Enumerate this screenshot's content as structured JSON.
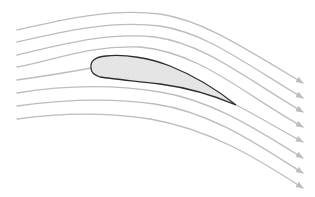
{
  "diagram": {
    "title": "",
    "colors": {
      "background": "#ffffff",
      "streamline": "#bdbdbd",
      "arrowhead": "#bdbdbd",
      "airfoil_fill": "#e4e4e4",
      "airfoil_stroke": "#2e2e2e"
    },
    "airfoil": {
      "label": "airfoil",
      "leading_edge": [
        91,
        68
      ],
      "trailing_edge": [
        236,
        105
      ]
    },
    "streamlines": [
      {
        "id": "streamline-1",
        "start": [
          17,
          30
        ],
        "end": [
          303,
          83
        ]
      },
      {
        "id": "streamline-2",
        "start": [
          17,
          42
        ],
        "end": [
          303,
          98
        ]
      },
      {
        "id": "streamline-3",
        "start": [
          17,
          55
        ],
        "end": [
          303,
          112
        ]
      },
      {
        "id": "streamline-4",
        "start": [
          17,
          67
        ],
        "end": [
          303,
          127
        ]
      },
      {
        "id": "streamline-5-stagnation",
        "start": [
          17,
          80
        ],
        "end": [
          303,
          142
        ]
      },
      {
        "id": "streamline-6",
        "start": [
          17,
          93
        ],
        "end": [
          303,
          158
        ]
      },
      {
        "id": "streamline-7",
        "start": [
          17,
          106
        ],
        "end": [
          303,
          173
        ]
      },
      {
        "id": "streamline-8",
        "start": [
          17,
          119
        ],
        "end": [
          303,
          188
        ]
      }
    ]
  }
}
